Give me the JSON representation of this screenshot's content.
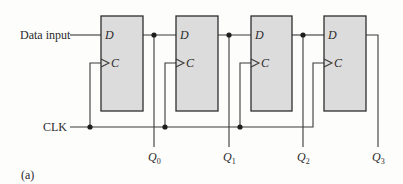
{
  "diagram": {
    "type": "shift-register",
    "figure_label": "(a)",
    "inputs": {
      "data_label": "Data input",
      "clock_label": "CLK"
    },
    "flip_flops": [
      {
        "name": "FF0",
        "pin_d": "D",
        "pin_c": "C",
        "output_label": "Q",
        "output_sub": "0"
      },
      {
        "name": "FF1",
        "pin_d": "D",
        "pin_c": "C",
        "output_label": "Q",
        "output_sub": "1"
      },
      {
        "name": "FF2",
        "pin_d": "D",
        "pin_c": "C",
        "output_label": "Q",
        "output_sub": "2"
      },
      {
        "name": "FF3",
        "pin_d": "D",
        "pin_c": "C",
        "output_label": "Q",
        "output_sub": "3"
      }
    ],
    "colors": {
      "flip_flop_fill": "#dcdcdc",
      "wire": "#3a3a3a",
      "background": "#fdfdfc"
    }
  }
}
